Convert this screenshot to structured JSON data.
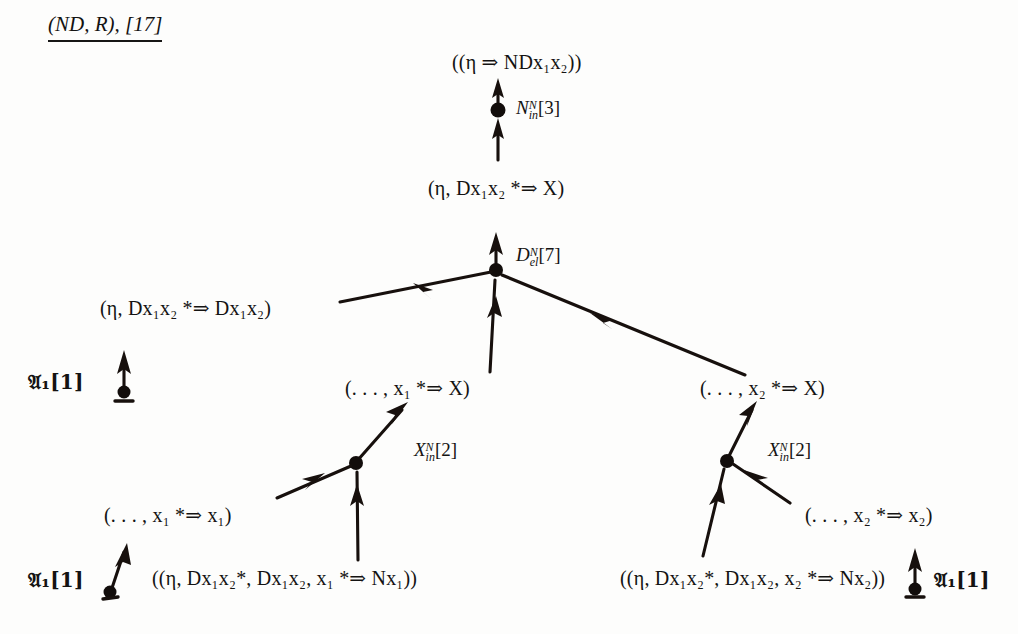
{
  "document": {
    "title": "(ND, R), [17]",
    "title_parts": {
      "calculus": "ND",
      "relation": "R",
      "reference": "[17]"
    },
    "kind": "proof-tree",
    "ink_color": "#17100d",
    "background_color": "#fdfdfc"
  },
  "tree": {
    "formulas": {
      "root": "((η ⇒ NDx₁x₂))",
      "level2": "(η, Dx₁x₂ *⇒ X)",
      "left_axiom_seq": "(η, Dx₁x₂ *⇒ Dx₁x₂)",
      "mid_x1": "(. . . , x₁ *⇒ X)",
      "mid_x2": "(. . . , x₂ *⇒ X)",
      "leaf_x1_ax": "(. . . , x₁ *⇒ x₁)",
      "leaf_x2_ax": "(. . . , x₂ *⇒ x₂)",
      "leaf_left": "((η, Dx₁x₂*, Dx₁x₂, x₁ *⇒ Nx₁))",
      "leaf_right": "((η, Dx₁x₂*, Dx₁x₂, x₂ *⇒ Nx₂))"
    },
    "rules": {
      "n_in": "Nᴺᵢₙ[3]",
      "d_el": "Dᴺₑₗ[7]",
      "x_in_left": "Xᴺᵢₙ[2]",
      "x_in_right": "Xᴺᵢₙ[2]",
      "axiom_top_left": "𝔄₁[1]",
      "axiom_bottom_left": "𝔄₁[1]",
      "axiom_bottom_right": "𝔄₁[1]"
    },
    "rule_parts": {
      "n_in": {
        "base": "N",
        "sup": "N",
        "sub": "in",
        "index": "[3]"
      },
      "d_el": {
        "base": "D",
        "sup": "N",
        "sub": "el",
        "index": "[7]"
      },
      "x_in_left": {
        "base": "X",
        "sup": "N",
        "sub": "in",
        "index": "[2]"
      },
      "x_in_right": {
        "base": "X",
        "sup": "N",
        "sub": "in",
        "index": "[2]"
      },
      "axiom": {
        "base": "𝔄",
        "sub": "1",
        "index": "[1]"
      }
    },
    "symbols": {
      "eta": "η",
      "double_arrow": "⇒",
      "star": "*",
      "ellipsis": ". . . ",
      "x1": "x₁",
      "x2": "x₂"
    },
    "edge_count": 11,
    "node_count": 9
  }
}
